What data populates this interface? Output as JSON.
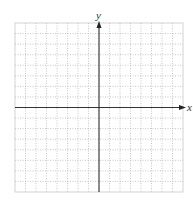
{
  "diagram": {
    "type": "coordinate-plane",
    "x_axis_label": "x",
    "y_axis_label": "y",
    "grid": {
      "columns": 16,
      "rows": 16,
      "columns_left_of_y_axis": 8,
      "rows_above_x_axis": 8,
      "line_style": "dotted",
      "border_style": "solid",
      "line_color": "#b8b8b8",
      "axis_color": "#333333"
    },
    "ticks_labeled": false
  }
}
